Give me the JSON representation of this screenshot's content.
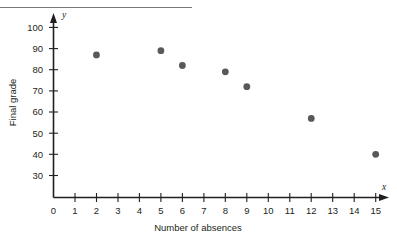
{
  "chart_data": {
    "type": "scatter",
    "title": "",
    "xlabel": "Number of absences",
    "ylabel": "Final grade",
    "x_axis_name": "x",
    "y_axis_name": "y",
    "xlim": [
      0,
      15
    ],
    "ylim": [
      25,
      103
    ],
    "grid": false,
    "legend": null,
    "x_ticks": [
      0,
      1,
      2,
      3,
      4,
      5,
      6,
      7,
      8,
      9,
      10,
      11,
      12,
      13,
      14,
      15
    ],
    "y_ticks": [
      30,
      40,
      50,
      60,
      70,
      80,
      90,
      100
    ],
    "x_tick_labels": [
      "0",
      "1",
      "2",
      "3",
      "4",
      "5",
      "6",
      "7",
      "8",
      "9",
      "10",
      "11",
      "12",
      "13",
      "14",
      "15"
    ],
    "y_tick_labels": [
      "30",
      "40",
      "50",
      "60",
      "70",
      "80",
      "90",
      "100"
    ],
    "points": [
      {
        "x": 2,
        "y": 87
      },
      {
        "x": 5,
        "y": 89
      },
      {
        "x": 6,
        "y": 82
      },
      {
        "x": 8,
        "y": 79
      },
      {
        "x": 9,
        "y": 72
      },
      {
        "x": 12,
        "y": 57
      },
      {
        "x": 15,
        "y": 40
      }
    ],
    "marker_color": "#58595b",
    "axis_color": "#231f20",
    "rule_color": "#77787b"
  }
}
